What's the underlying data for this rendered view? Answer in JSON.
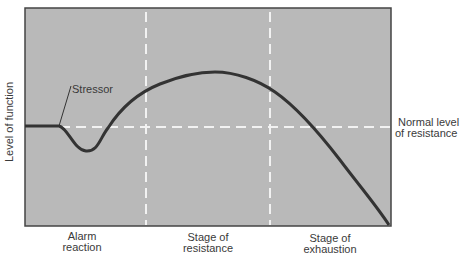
{
  "diagram": {
    "y_axis_label": "Level of function",
    "stressor_label": "Stressor",
    "baseline_label_line1": "Normal level",
    "baseline_label_line2": "of resistance",
    "stages": [
      {
        "line1": "Alarm",
        "line2": "reaction"
      },
      {
        "line1": "Stage of",
        "line2": "resistance"
      },
      {
        "line1": "Stage of",
        "line2": "exhaustion"
      }
    ],
    "colors": {
      "panel": "#b9b9b9",
      "curve": "#333333",
      "dash": "#f2f2f2",
      "border": "#444444"
    }
  }
}
